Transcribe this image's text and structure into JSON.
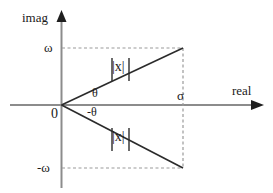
{
  "diagram": {
    "axes": {
      "imaginary_axis_label": "imag",
      "real_axis_label": "real",
      "origin_label": "0"
    },
    "tick_labels": {
      "positive_omega": "ω",
      "negative_omega": "-ω",
      "sigma": "σ"
    },
    "angle_labels": {
      "positive_theta": "θ",
      "negative_theta": "-θ"
    },
    "magnitude_labels": {
      "upper": "|x|",
      "lower": "|x|"
    },
    "colors": {
      "axis": "#8c8c8c",
      "line": "#2b2b2b",
      "dashed": "#9a9a9a",
      "text": "#1a1a1a",
      "background": "#ffffff"
    },
    "geometry": {
      "origin": [
        61,
        105
      ],
      "omega_y": 48,
      "negative_omega_y": 168,
      "sigma_x": 183,
      "real_axis_arrow_x": 262,
      "imag_axis_arrow_y": 12
    }
  }
}
